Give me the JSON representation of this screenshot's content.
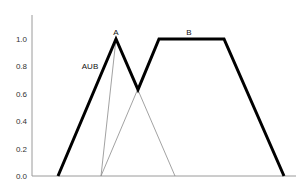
{
  "chart_data": {
    "type": "line",
    "title": "",
    "xlabel": "",
    "ylabel": "",
    "ylim": [
      0,
      1.0
    ],
    "xlim": [
      0,
      264
    ],
    "x_ticks_shown": false,
    "y_ticks": [
      "0.0",
      "0.2",
      "0.4",
      "0.6",
      "0.8",
      "1.0"
    ],
    "grid": false,
    "legend": null,
    "series": [
      {
        "name": "A",
        "style": "thin",
        "points": [
          [
            69,
            0.0
          ],
          [
            84,
            1.0
          ],
          [
            143,
            0.0
          ]
        ]
      },
      {
        "name": "B",
        "style": "thin",
        "points": [
          [
            69,
            0.0
          ],
          [
            127,
            1.0
          ],
          [
            192,
            1.0
          ],
          [
            252,
            0.0
          ]
        ]
      },
      {
        "name": "AUB",
        "style": "thick",
        "points": [
          [
            26,
            0.0
          ],
          [
            84,
            1.0
          ],
          [
            106,
            0.63
          ],
          [
            127,
            1.0
          ],
          [
            192,
            1.0
          ],
          [
            252,
            0.0
          ]
        ]
      }
    ],
    "annotations": [
      {
        "text": "A",
        "x": 84,
        "y": 1.0
      },
      {
        "text": "B",
        "x": 157,
        "y": 1.0
      },
      {
        "text": "AUB",
        "x": 58,
        "y": 0.8
      }
    ]
  }
}
